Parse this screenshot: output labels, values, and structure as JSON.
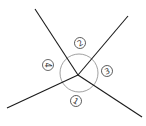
{
  "diagram": {
    "title": "",
    "line_color": "#1a1a1a",
    "circle_color": "#888888",
    "intersection": {
      "x": 78,
      "y": 75
    },
    "center_circle": {
      "cx": 79,
      "cy": 73,
      "r": 19
    },
    "rays": [
      {
        "name": "upper-left",
        "x": 35,
        "y": 9
      },
      {
        "name": "upper-right",
        "x": 128,
        "y": 16
      },
      {
        "name": "lower-left",
        "x": 7,
        "y": 108
      },
      {
        "name": "lower-right",
        "x": 142,
        "y": 117
      }
    ],
    "angle_labels": [
      {
        "id": "angle-2",
        "text": "2",
        "x": 80,
        "y": 43,
        "rotate": -30
      },
      {
        "id": "angle-4",
        "text": "4",
        "x": 48,
        "y": 65,
        "rotate": 90
      },
      {
        "id": "angle-3",
        "text": "3",
        "x": 107,
        "y": 71,
        "rotate": -20
      },
      {
        "id": "angle-1",
        "text": "1",
        "x": 76,
        "y": 101,
        "rotate": 30
      }
    ]
  }
}
